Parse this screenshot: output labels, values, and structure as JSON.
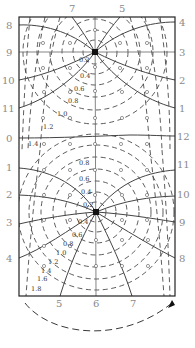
{
  "diagram": {
    "type": "flow-net",
    "frame": {
      "left": 19,
      "top": 17,
      "right": 175,
      "bottom": 296
    },
    "sources": [
      {
        "name": "upper-well",
        "x": 95,
        "y": 52
      },
      {
        "name": "lower-well",
        "x": 96,
        "y": 212
      }
    ],
    "top_labels": [
      {
        "text": "7",
        "x": 71,
        "y": 12
      },
      {
        "text": "5",
        "x": 122,
        "y": 12
      }
    ],
    "left_labels": [
      {
        "text": "8",
        "x": 6,
        "y": 29
      },
      {
        "text": "9",
        "x": 6,
        "y": 56
      },
      {
        "text": "10",
        "x": 2,
        "y": 83
      },
      {
        "text": "11",
        "x": 2,
        "y": 111
      },
      {
        "text": "0",
        "x": 6,
        "y": 139
      },
      {
        "text": "1",
        "x": 6,
        "y": 167
      },
      {
        "text": "2",
        "x": 6,
        "y": 194
      },
      {
        "text": "3",
        "x": 6,
        "y": 222
      },
      {
        "text": "4",
        "x": 6,
        "y": 262
      }
    ],
    "right_labels": [
      {
        "text": "4",
        "x": 179,
        "y": 26
      },
      {
        "text": "3",
        "x": 179,
        "y": 56
      },
      {
        "text": "2",
        "x": 179,
        "y": 84
      },
      {
        "text": "1",
        "x": 179,
        "y": 112
      },
      {
        "text": "12",
        "x": 177,
        "y": 140
      },
      {
        "text": "11",
        "x": 177,
        "y": 168
      },
      {
        "text": "10",
        "x": 177,
        "y": 198
      },
      {
        "text": "9",
        "x": 179,
        "y": 226
      },
      {
        "text": "8",
        "x": 179,
        "y": 262
      }
    ],
    "bottom_labels": [
      {
        "text": "5",
        "x": 56,
        "y": 307
      },
      {
        "text": "6",
        "x": 93,
        "y": 307
      },
      {
        "text": "7",
        "x": 130,
        "y": 307
      }
    ],
    "potential_values_upper": [
      {
        "text": "0.2",
        "x": 79,
        "y": 62
      },
      {
        "text": "0.4",
        "x": 80,
        "y": 78
      },
      {
        "text": "0.6",
        "x": 73,
        "y": 91
      },
      {
        "text": "0.8",
        "x": 68,
        "y": 103
      },
      {
        "text": "1.0",
        "x": 57,
        "y": 117
      },
      {
        "text": "1.2",
        "x": 43,
        "y": 130
      },
      {
        "text": "1.4",
        "x": 28,
        "y": 146
      }
    ],
    "potential_values_lower": [
      {
        "text": "0.8",
        "x": 79,
        "y": 165
      },
      {
        "text": "0.6",
        "x": 79,
        "y": 182
      },
      {
        "text": "0.4",
        "x": 81,
        "y": 195
      },
      {
        "text": "0.2",
        "x": 83,
        "y": 208
      },
      {
        "text": "0.4",
        "x": 78,
        "y": 224
      },
      {
        "text": "0.6",
        "x": 73,
        "y": 238
      },
      {
        "text": "0.8",
        "x": 63,
        "y": 246
      },
      {
        "text": "1.0",
        "x": 56,
        "y": 255
      },
      {
        "text": "1.2",
        "x": 48,
        "y": 264
      },
      {
        "text": "1.4",
        "x": 41,
        "y": 272
      },
      {
        "text": "1.6",
        "x": 37,
        "y": 280
      },
      {
        "text": "1.8",
        "x": 33,
        "y": 290
      }
    ]
  }
}
